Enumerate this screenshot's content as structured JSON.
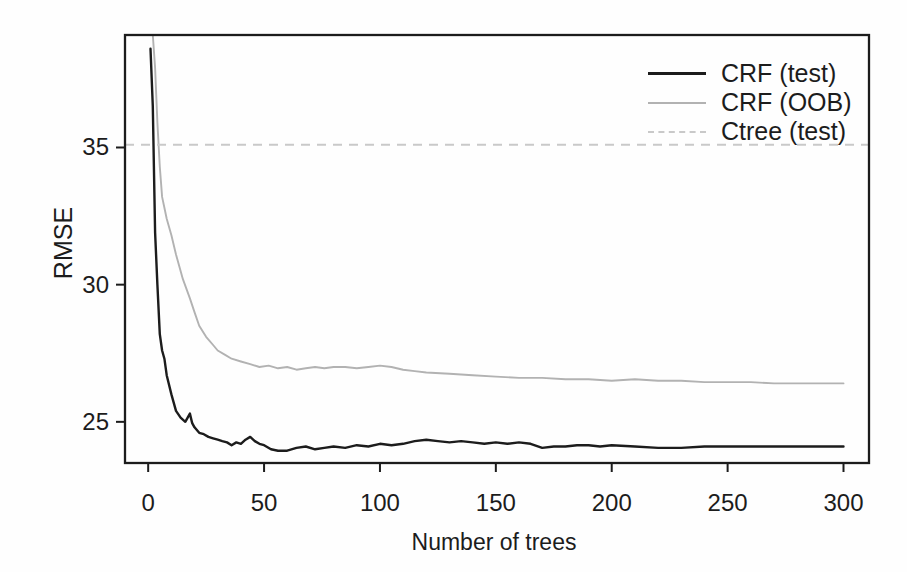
{
  "page": {
    "background": "#fefefe",
    "ink_color": "#1c1c1c"
  },
  "chart_data": {
    "type": "line",
    "title": "",
    "xlabel": "Number of trees",
    "ylabel": "RMSE",
    "xlim": [
      -10,
      311
    ],
    "ylim": [
      23.5,
      39.1
    ],
    "x_ticks": [
      0,
      50,
      100,
      150,
      200,
      250,
      300
    ],
    "y_ticks": [
      25,
      30,
      35
    ],
    "grid": false,
    "legend_position": "top-right-inside",
    "series": [
      {
        "name": "CRF (test)",
        "color": "#1c1c1c",
        "style": "solid",
        "width": 2.4,
        "x": [
          1,
          2,
          3,
          4,
          5,
          6,
          7,
          8,
          10,
          12,
          14,
          16,
          18,
          19,
          20,
          22,
          24,
          26,
          28,
          30,
          32,
          34,
          36,
          38,
          40,
          42,
          44,
          46,
          48,
          50,
          53,
          56,
          60,
          64,
          68,
          72,
          76,
          80,
          85,
          90,
          95,
          100,
          105,
          110,
          115,
          120,
          125,
          130,
          135,
          140,
          145,
          150,
          155,
          160,
          165,
          170,
          175,
          180,
          185,
          190,
          195,
          200,
          210,
          220,
          230,
          240,
          250,
          260,
          270,
          280,
          290,
          300
        ],
        "values": [
          38.6,
          36.5,
          31.9,
          30.0,
          28.2,
          27.6,
          27.3,
          26.7,
          26.0,
          25.4,
          25.15,
          25.0,
          25.3,
          24.95,
          24.8,
          24.6,
          24.55,
          24.45,
          24.4,
          24.35,
          24.3,
          24.25,
          24.15,
          24.25,
          24.2,
          24.35,
          24.45,
          24.3,
          24.2,
          24.15,
          24.0,
          23.95,
          23.95,
          24.05,
          24.1,
          24.0,
          24.05,
          24.1,
          24.05,
          24.15,
          24.1,
          24.2,
          24.15,
          24.2,
          24.3,
          24.35,
          24.3,
          24.25,
          24.3,
          24.25,
          24.2,
          24.25,
          24.2,
          24.25,
          24.2,
          24.05,
          24.1,
          24.1,
          24.15,
          24.15,
          24.1,
          24.15,
          24.1,
          24.05,
          24.05,
          24.1,
          24.1,
          24.1,
          24.1,
          24.1,
          24.1,
          24.1
        ]
      },
      {
        "name": "CRF (OOB)",
        "color": "#b2b2b2",
        "style": "solid",
        "width": 1.9,
        "x": [
          2,
          3,
          4,
          5,
          6,
          7,
          8,
          10,
          12,
          15,
          18,
          20,
          22,
          25,
          28,
          30,
          33,
          36,
          40,
          44,
          48,
          52,
          56,
          60,
          64,
          68,
          72,
          76,
          80,
          85,
          90,
          95,
          100,
          105,
          110,
          115,
          120,
          130,
          140,
          150,
          160,
          170,
          180,
          190,
          200,
          210,
          220,
          230,
          240,
          250,
          260,
          270,
          280,
          290,
          300
        ],
        "values": [
          39.1,
          37.9,
          35.9,
          34.3,
          33.2,
          32.8,
          32.4,
          31.8,
          31.1,
          30.2,
          29.5,
          29.0,
          28.5,
          28.1,
          27.8,
          27.6,
          27.45,
          27.3,
          27.2,
          27.1,
          27.0,
          27.05,
          26.95,
          27.0,
          26.9,
          26.95,
          27.0,
          26.95,
          27.0,
          27.0,
          26.95,
          27.0,
          27.05,
          27.0,
          26.9,
          26.85,
          26.8,
          26.75,
          26.7,
          26.65,
          26.6,
          26.6,
          26.55,
          26.55,
          26.5,
          26.55,
          26.5,
          26.5,
          26.45,
          26.45,
          26.45,
          26.4,
          26.4,
          26.4,
          26.4
        ]
      },
      {
        "name": "Ctree (test)",
        "color": "#c9c9c9",
        "style": "dashed",
        "width": 1.9,
        "constant": 35.1
      }
    ]
  }
}
